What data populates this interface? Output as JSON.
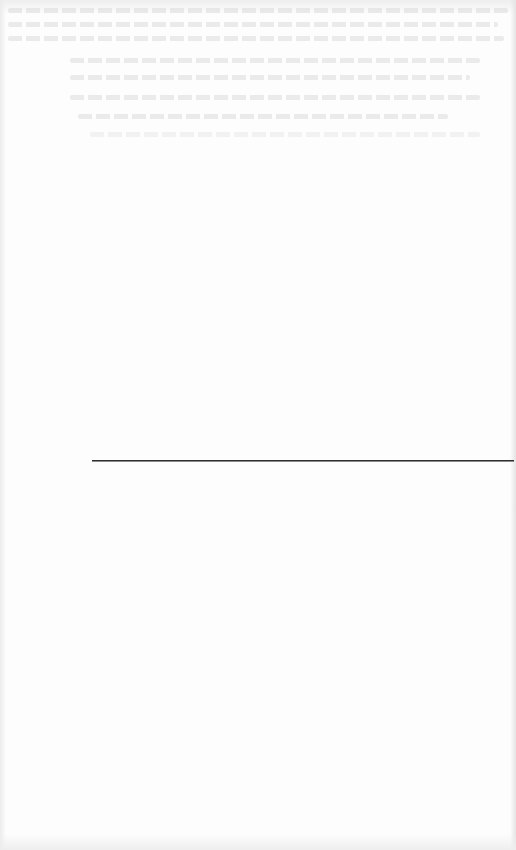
{
  "document": {
    "type": "scanned-page",
    "background_color": "#fdfdfd",
    "bleed_through": {
      "legible": false,
      "top_block_lines": 3,
      "indented_block_lines": 5
    },
    "rule": {
      "kind": "footnote-separator",
      "color": "#2f2f2f",
      "x_start": 92,
      "x_end": 514,
      "y": 460
    }
  }
}
